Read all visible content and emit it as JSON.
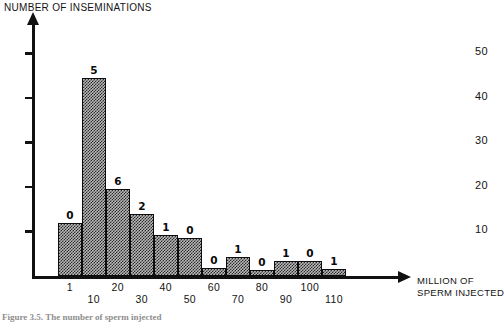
{
  "figure": {
    "caption": "Figure 3.5.    The number of sperm injected",
    "background": "#ffffff",
    "ink_color": "#111111"
  },
  "chart_data": {
    "type": "bar",
    "title": "",
    "ylabel": "NUMBER OF INSEMINATIONS",
    "xlabel": "MILLION OF SPERM INJECTED",
    "xlabel_line1": "MILLION OF",
    "xlabel_line2": "SPERM INJECTED",
    "ylim": [
      0,
      57
    ],
    "yticks": [
      10,
      20,
      30,
      40,
      50
    ],
    "ytick_labels": [
      "10",
      "20",
      "30",
      "40",
      "50"
    ],
    "grid": false,
    "legend": false,
    "categories": [
      "1",
      "10",
      "20",
      "30",
      "40",
      "50",
      "60",
      "70",
      "80",
      "90",
      "100",
      "110"
    ],
    "xtick_labels_upper": [
      "1",
      "20",
      "40",
      "60",
      "80",
      "100"
    ],
    "xtick_labels_lower": [
      "10",
      "30",
      "50",
      "70",
      "90",
      "110"
    ],
    "values": [
      12,
      44.5,
      19.5,
      14,
      9.2,
      8.6,
      1.8,
      4.3,
      1.3,
      3.3,
      3.3,
      1.5
    ],
    "bar_annotations": [
      "0",
      "5",
      "6",
      "2",
      "1",
      "0",
      "0",
      "1",
      "0",
      "1",
      "0",
      "1"
    ],
    "series": [
      {
        "name": "Inseminations",
        "values": [
          12,
          44.5,
          19.5,
          14,
          9.2,
          8.6,
          1.8,
          4.3,
          1.3,
          3.3,
          3.3,
          1.5
        ]
      }
    ],
    "bar_fill": "#b9b9b9",
    "bar_edge": "#0d0d0d"
  }
}
